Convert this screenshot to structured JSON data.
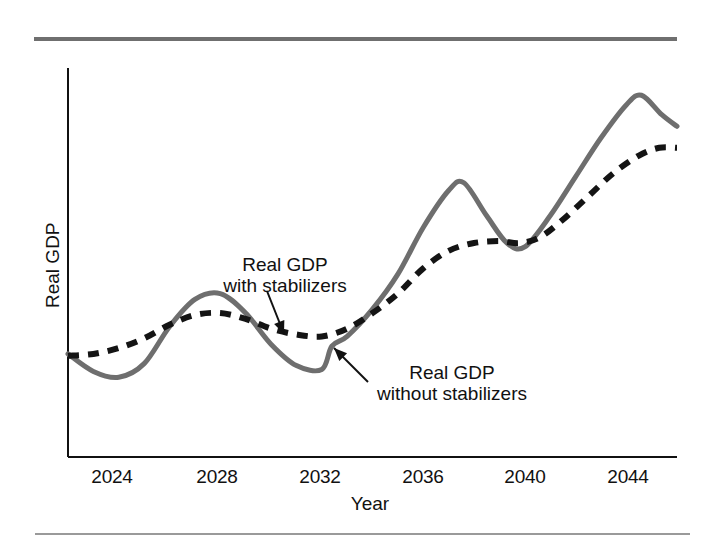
{
  "figure": {
    "background": "#ffffff",
    "width": 714,
    "height": 543
  },
  "chart_data": {
    "type": "line",
    "title": "",
    "xlabel": "Year",
    "ylabel": "Real GDP",
    "grid": false,
    "legend_position": "inline-annotations",
    "xlim": [
      2022,
      2046
    ],
    "ylim": [
      0,
      100
    ],
    "x_tick_labels": [
      "2024",
      "2028",
      "2032",
      "2036",
      "2040",
      "2044"
    ],
    "x_tick_values": [
      2024,
      2028,
      2032,
      2036,
      2040,
      2044
    ],
    "y_tick_labels": [],
    "series": [
      {
        "name": "Real GDP without stabilizers",
        "style": "solid",
        "color": "#6e6e6e",
        "width": 5,
        "x": [
          2022.0,
          2023.0,
          2024.0,
          2025.0,
          2026.0,
          2027.0,
          2028.0,
          2029.0,
          2030.0,
          2031.0,
          2032.0,
          2032.4,
          2033.0,
          2034.0,
          2035.0,
          2036.0,
          2037.0,
          2037.6,
          2038.5,
          2039.3,
          2040.0,
          2041.0,
          2042.0,
          2043.0,
          2044.0,
          2044.6,
          2045.4,
          2046.0
        ],
        "y": [
          26.5,
          22.0,
          20.5,
          24.0,
          33.5,
          40.5,
          42.0,
          37.0,
          29.0,
          23.5,
          22.5,
          28.5,
          31.0,
          38.0,
          47.0,
          59.0,
          68.5,
          70.5,
          62.0,
          55.0,
          54.0,
          62.0,
          72.0,
          82.0,
          90.5,
          93.0,
          88.0,
          85.0
        ]
      },
      {
        "name": "Real GDP with stabilizers",
        "style": "dashed",
        "color": "#141414",
        "width": 6,
        "x": [
          2022.0,
          2023.0,
          2024.0,
          2025.0,
          2026.0,
          2027.0,
          2028.0,
          2029.0,
          2030.0,
          2031.0,
          2032.0,
          2033.0,
          2034.0,
          2035.0,
          2036.0,
          2037.0,
          2038.0,
          2039.0,
          2039.8,
          2040.6,
          2041.5,
          2042.5,
          2043.5,
          2044.5,
          2045.3,
          2046.0
        ],
        "y": [
          26.0,
          26.5,
          28.0,
          30.5,
          34.0,
          36.5,
          37.0,
          35.5,
          33.0,
          31.5,
          31.0,
          33.0,
          37.0,
          42.0,
          48.5,
          53.0,
          55.0,
          55.5,
          55.0,
          56.5,
          61.0,
          67.0,
          73.0,
          77.5,
          79.5,
          79.5
        ]
      }
    ],
    "annotations": [
      {
        "id": "with-stabilizers",
        "lines": [
          "Real GDP",
          "with stabilizers"
        ],
        "text_x": 285,
        "text_y": 254,
        "arrow_from": [
          267,
          291
        ],
        "arrow_to": [
          284,
          334
        ]
      },
      {
        "id": "without-stabilizers",
        "lines": [
          "Real GDP",
          "without stabilizers"
        ],
        "text_x": 452,
        "text_y": 362,
        "arrow_from": [
          368,
          382
        ],
        "arrow_to": [
          334,
          348
        ]
      }
    ]
  },
  "axes": {
    "x_axis_color": "#111111",
    "y_axis_color": "#111111",
    "plot_left": 68,
    "plot_right": 677,
    "plot_top": 68,
    "plot_bottom": 457
  },
  "colors": {
    "rule": "#6f6f6f",
    "rule_bottom": "#9a9a9a",
    "solid_line": "#6e6e6e",
    "dashed_line": "#141414",
    "text": "#111111"
  }
}
